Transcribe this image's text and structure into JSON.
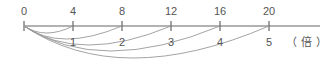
{
  "diagram": {
    "type": "number-line",
    "top_labels": [
      "0",
      "4",
      "8",
      "12",
      "16",
      "20"
    ],
    "bottom_labels": [
      "1",
      "2",
      "3",
      "4",
      "5"
    ],
    "unit": "（倍）",
    "colors": {
      "line": "#666666",
      "arc": "#999999",
      "text": "#555555"
    }
  }
}
